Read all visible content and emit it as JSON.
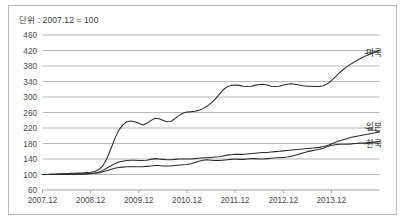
{
  "figure": {
    "unit_note": "단위 : 2007.12 = 100",
    "frame_color": "#b9b9b9",
    "line_color": "#2b2b2b",
    "grid_color": "#9a9a9a",
    "background": "#ffffff"
  },
  "chart_data": {
    "type": "line",
    "title": "",
    "subtitle": "",
    "xlabel": "",
    "ylabel": "",
    "unit_note": "단위 : 2007.12 = 100",
    "grid": true,
    "grid_axis": "y",
    "legend_position": "right-inline-labels",
    "xlim": [
      2007.0,
      2014.0
    ],
    "ylim": [
      60,
      460
    ],
    "ytick_labels": [
      "60",
      "100",
      "140",
      "180",
      "220",
      "260",
      "300",
      "340",
      "380",
      "420",
      "460"
    ],
    "ytick_values": [
      60,
      100,
      140,
      180,
      220,
      260,
      300,
      340,
      380,
      420,
      460
    ],
    "xtick_labels": [
      "2007.12",
      "2008.12",
      "2009.12",
      "2010.12",
      "2011.12",
      "2012.12",
      "2013.12"
    ],
    "xtick_values": [
      2007.0,
      2008.0,
      2009.0,
      2010.0,
      2011.0,
      2012.0,
      2013.0
    ],
    "x": [
      2007.0,
      2007.0833,
      2007.1667,
      2007.25,
      2007.3333,
      2007.4167,
      2007.5,
      2007.5833,
      2007.6667,
      2007.75,
      2007.8333,
      2007.9167,
      2008.0,
      2008.0833,
      2008.1667,
      2008.25,
      2008.3333,
      2008.4167,
      2008.5,
      2008.5833,
      2008.6667,
      2008.75,
      2008.8333,
      2008.9167,
      2009.0,
      2009.0833,
      2009.1667,
      2009.25,
      2009.3333,
      2009.4167,
      2009.5,
      2009.5833,
      2009.6667,
      2009.75,
      2009.8333,
      2009.9167,
      2010.0,
      2010.0833,
      2010.1667,
      2010.25,
      2010.3333,
      2010.4167,
      2010.5,
      2010.5833,
      2010.6667,
      2010.75,
      2010.8333,
      2010.9167,
      2011.0,
      2011.0833,
      2011.1667,
      2011.25,
      2011.3333,
      2011.4167,
      2011.5,
      2011.5833,
      2011.6667,
      2011.75,
      2011.8333,
      2011.9167,
      2012.0,
      2012.0833,
      2012.1667,
      2012.25,
      2012.3333,
      2012.4167,
      2012.5,
      2012.5833,
      2012.6667,
      2012.75,
      2012.8333,
      2012.9167,
      2013.0,
      2013.0833,
      2013.1667,
      2013.25,
      2013.3333,
      2013.4167,
      2013.5,
      2013.5833,
      2013.6667,
      2013.75,
      2013.8333,
      2013.9167,
      2014.0
    ],
    "series": [
      {
        "name": "미국",
        "label": "미국",
        "label_position": {
          "x": 2013.72,
          "y": 413
        },
        "values": [
          100,
          100,
          101,
          101,
          102,
          102,
          102,
          103,
          103,
          104,
          104,
          105,
          106,
          108,
          112,
          122,
          140,
          165,
          192,
          214,
          228,
          236,
          238,
          236,
          232,
          228,
          232,
          239,
          245,
          244,
          240,
          236,
          237,
          244,
          252,
          258,
          261,
          262,
          263,
          266,
          270,
          276,
          284,
          294,
          306,
          318,
          326,
          330,
          331,
          330,
          328,
          327,
          328,
          330,
          332,
          333,
          331,
          328,
          327,
          328,
          331,
          333,
          334,
          333,
          331,
          329,
          328,
          328,
          327,
          327,
          329,
          334,
          342,
          352,
          362,
          371,
          379,
          386,
          392,
          398,
          403,
          408,
          412,
          416,
          420
        ]
      },
      {
        "name": "일본",
        "label": "일본",
        "label_position": {
          "x": 2013.72,
          "y": 222
        },
        "values": [
          100,
          100,
          100,
          100,
          100,
          101,
          101,
          101,
          101,
          102,
          102,
          102,
          103,
          104,
          106,
          110,
          116,
          122,
          128,
          132,
          134,
          136,
          137,
          137,
          136,
          136,
          137,
          139,
          141,
          140,
          139,
          138,
          138,
          139,
          140,
          140,
          140,
          140,
          141,
          142,
          143,
          143,
          144,
          145,
          146,
          148,
          150,
          151,
          152,
          152,
          152,
          153,
          154,
          155,
          156,
          157,
          157,
          158,
          159,
          160,
          161,
          162,
          163,
          164,
          165,
          166,
          167,
          168,
          169,
          170,
          172,
          175,
          179,
          183,
          187,
          190,
          193,
          196,
          198,
          200,
          202,
          204,
          206,
          208,
          210
        ]
      },
      {
        "name": "한국",
        "label": "한국",
        "label_position": {
          "x": 2013.72,
          "y": 180
        },
        "values": [
          100,
          100,
          100,
          100,
          100,
          100,
          100,
          100,
          100,
          101,
          101,
          101,
          102,
          103,
          104,
          107,
          110,
          113,
          116,
          118,
          119,
          120,
          120,
          120,
          120,
          120,
          121,
          122,
          123,
          123,
          122,
          122,
          122,
          123,
          124,
          125,
          126,
          128,
          131,
          134,
          137,
          138,
          137,
          136,
          136,
          137,
          138,
          139,
          140,
          139,
          139,
          140,
          141,
          141,
          140,
          140,
          141,
          142,
          143,
          143,
          144,
          145,
          147,
          150,
          153,
          156,
          159,
          161,
          163,
          165,
          168,
          172,
          175,
          177,
          178,
          178,
          178,
          179,
          180,
          181,
          181,
          182,
          183,
          184,
          185
        ]
      }
    ]
  }
}
